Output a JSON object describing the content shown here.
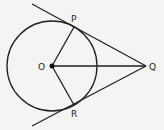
{
  "diagram": {
    "points": {
      "O": {
        "label": "O",
        "x": 52,
        "y": 66
      },
      "P": {
        "label": "P",
        "x": 74,
        "y": 27
      },
      "R": {
        "label": "R",
        "x": 74,
        "y": 105
      },
      "Q": {
        "label": "Q",
        "x": 146,
        "y": 66
      }
    },
    "circle": {
      "center": "O",
      "r": 45
    },
    "segments": [
      "OP",
      "OR",
      "OQ",
      "PQ",
      "RQ"
    ],
    "tangent_lines": [
      "QP extended",
      "QR extended"
    ],
    "colors": {
      "stroke": "#222222",
      "background": "#f4f4f2"
    }
  }
}
